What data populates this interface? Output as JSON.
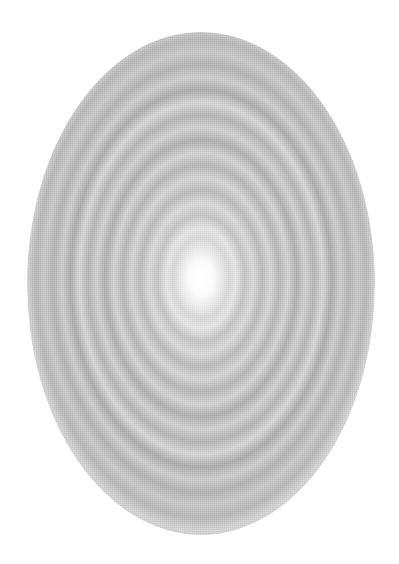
{
  "image": {
    "subject": "concentric-rings-ellipse",
    "background_color": "#ffffff",
    "center_color": "#ffffff",
    "ring_colors": [
      "#9a9a9a",
      "#c8c8c8",
      "#a8a8a8",
      "#d2d2d2",
      "#8e8e8e",
      "#bdbdbd",
      "#a3a3a3",
      "#cfcfcf",
      "#969696",
      "#c4c4c4",
      "#aaaaaa",
      "#d6d6d6",
      "#b0b0b0",
      "#e2e2e2",
      "#f3f3f3"
    ]
  }
}
